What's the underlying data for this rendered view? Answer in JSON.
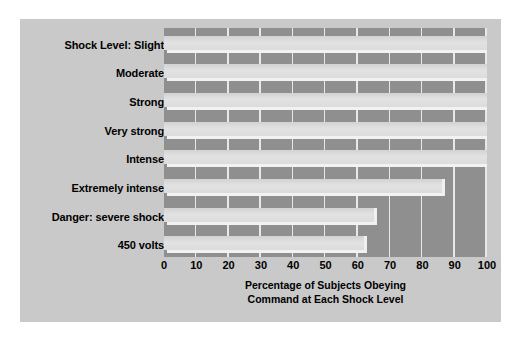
{
  "chart_data": {
    "type": "bar",
    "orientation": "horizontal",
    "title": "",
    "subtitle": "",
    "categories": [
      "Shock Level:     Slight",
      "Moderate",
      "Strong",
      "Very strong",
      "Intense",
      "Extremely intense",
      "Danger: severe shock",
      "450 volts"
    ],
    "values": [
      100,
      100,
      100,
      100,
      100,
      86,
      65,
      62
    ],
    "xlabel_line1": "Percentage of Subjects Obeying",
    "xlabel_line2": "Command at Each Shock Level",
    "ylabel": "",
    "xlim": [
      0,
      100
    ],
    "xticks": [
      0,
      10,
      20,
      30,
      40,
      50,
      60,
      70,
      80,
      90,
      100
    ],
    "xtick_labels": [
      "0",
      "10",
      "20",
      "30",
      "40",
      "50",
      "60",
      "70",
      "80",
      "90",
      "100"
    ],
    "grid": true,
    "grid_axis": "x",
    "legend": "none",
    "colors": {
      "figure_background": "#c9c9c9",
      "plot_background": "#8f8f8f",
      "bar_fill": "#dcdcdc",
      "gridline": "#e8e8e8",
      "text": "#000000",
      "page_background": "#ffffff"
    }
  }
}
